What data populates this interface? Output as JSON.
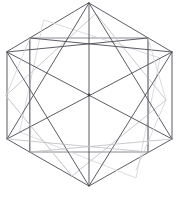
{
  "figure": {
    "type": "line-diagram",
    "canvas": {
      "width": 179,
      "height": 200
    },
    "background_color": "#ffffff",
    "stroke_colors": {
      "dark": "#4a4a52",
      "mid": "#6d6d76",
      "light": "#bcbcc2",
      "faint": "#d2d2d6"
    },
    "vertices": {
      "hex_top": [
        89,
        3
      ],
      "hex_upper_left": [
        7,
        52
      ],
      "hex_upper_right": [
        172,
        52
      ],
      "hex_lower_left": [
        7,
        139
      ],
      "hex_lower_right": [
        172,
        139
      ],
      "hex_bottom": [
        89,
        186
      ],
      "rect_top_left": [
        30,
        38
      ],
      "rect_top_right": [
        148,
        38
      ],
      "rect_bottom_left": [
        30,
        152
      ],
      "rect_bottom_right": [
        148,
        152
      ],
      "diamond_left": [
        6,
        96
      ],
      "diamond_top": [
        96,
        14
      ],
      "diamond_right": [
        166,
        100
      ],
      "diamond_bottom": [
        72,
        176
      ],
      "center": [
        89,
        95
      ]
    },
    "shapes": [
      {
        "name": "outer-hexagon",
        "tone": "dark",
        "closed": true,
        "points": "89,3 172,52 172,139 89,186 7,139 7,52"
      },
      {
        "name": "inner-rectangle",
        "tone": "mid",
        "closed": true,
        "points": "30,38 148,38 148,152 30,152"
      },
      {
        "name": "rotated-square",
        "tone": "light",
        "closed": true,
        "points": "96,14 166,100 72,176 6,96"
      },
      {
        "name": "secondary-quad",
        "tone": "faint",
        "closed": true,
        "points": "44,20 160,58 136,178 20,132"
      }
    ],
    "lines": [
      {
        "name": "hex-diagonal-left-to-right",
        "tone": "dark",
        "from": [
          7,
          52
        ],
        "to": [
          172,
          139
        ]
      },
      {
        "name": "hex-diagonal-right-to-left",
        "tone": "dark",
        "from": [
          172,
          52
        ],
        "to": [
          7,
          139
        ]
      },
      {
        "name": "hex-vertical-axis",
        "tone": "dark",
        "from": [
          89,
          3
        ],
        "to": [
          89,
          186
        ]
      },
      {
        "name": "top-to-lower-left",
        "tone": "dark",
        "from": [
          89,
          3
        ],
        "to": [
          7,
          139
        ]
      },
      {
        "name": "top-to-lower-right",
        "tone": "dark",
        "from": [
          89,
          3
        ],
        "to": [
          172,
          139
        ]
      },
      {
        "name": "bottom-to-upper-left",
        "tone": "dark",
        "from": [
          89,
          186
        ],
        "to": [
          7,
          52
        ]
      },
      {
        "name": "bottom-to-upper-right",
        "tone": "dark",
        "from": [
          89,
          186
        ],
        "to": [
          172,
          52
        ]
      },
      {
        "name": "rect-left-edge",
        "tone": "mid",
        "from": [
          30,
          38
        ],
        "to": [
          30,
          152
        ]
      },
      {
        "name": "rect-right-edge",
        "tone": "mid",
        "from": [
          148,
          38
        ],
        "to": [
          148,
          152
        ]
      },
      {
        "name": "upper-chord-left",
        "tone": "dark",
        "from": [
          7,
          52
        ],
        "to": [
          148,
          38
        ]
      },
      {
        "name": "upper-chord-right",
        "tone": "dark",
        "from": [
          172,
          52
        ],
        "to": [
          30,
          38
        ]
      },
      {
        "name": "lower-chord-left",
        "tone": "light",
        "from": [
          7,
          139
        ],
        "to": [
          148,
          152
        ]
      },
      {
        "name": "lower-chord-right",
        "tone": "light",
        "from": [
          172,
          139
        ],
        "to": [
          30,
          152
        ]
      },
      {
        "name": "light-strut-upper-left",
        "tone": "faint",
        "from": [
          30,
          38
        ],
        "to": [
          6,
          96
        ]
      },
      {
        "name": "light-strut-upper-right",
        "tone": "faint",
        "from": [
          148,
          38
        ],
        "to": [
          166,
          100
        ]
      },
      {
        "name": "light-strut-lower-left",
        "tone": "faint",
        "from": [
          6,
          96
        ],
        "to": [
          72,
          176
        ]
      },
      {
        "name": "light-strut-lower-right",
        "tone": "faint",
        "from": [
          166,
          100
        ],
        "to": [
          136,
          170
        ]
      }
    ],
    "marked_vertices": [
      {
        "name": "center-node",
        "at": [
          89,
          95
        ]
      }
    ]
  }
}
